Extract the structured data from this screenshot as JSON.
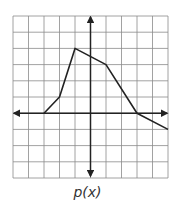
{
  "chart_data": {
    "type": "line",
    "title": "p(x)",
    "xlabel": "",
    "ylabel": "",
    "xlim": [
      -5,
      5
    ],
    "ylim": [
      -4,
      6
    ],
    "grid": true,
    "grid_step": 1,
    "tick_labels": "none",
    "series": [
      {
        "name": "p(x)",
        "points": [
          [
            -3,
            0
          ],
          [
            -2,
            1
          ],
          [
            -1,
            4
          ],
          [
            1,
            3
          ],
          [
            3,
            0
          ],
          [
            5,
            -1
          ]
        ]
      }
    ]
  },
  "caption": "p(x)",
  "colors": {
    "grid": "#8a8a8a",
    "axis": "#222222",
    "line": "#222222",
    "background": "#ffffff"
  }
}
